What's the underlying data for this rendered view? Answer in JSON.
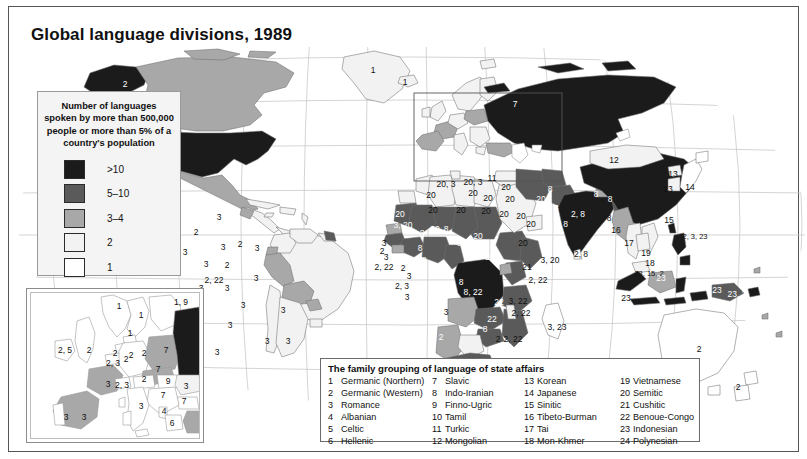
{
  "title": "Global language divisions, 1989",
  "legend": {
    "heading": "Number of languages spoken by more than 500,000 people or more than 5% of a country's population",
    "classes": [
      {
        "label": ">10",
        "color": "#1b1b1b"
      },
      {
        "label": "5–10",
        "color": "#5a5a5a"
      },
      {
        "label": "3–4",
        "color": "#a8a8a8"
      },
      {
        "label": "2",
        "color": "#f2f2f2"
      },
      {
        "label": "1",
        "color": "#ffffff"
      }
    ]
  },
  "family_table": {
    "title": "The family grouping of language of state affairs",
    "columns": [
      [
        {
          "n": "1",
          "label": "Germanic (Northern)"
        },
        {
          "n": "2",
          "label": "Germanic (Western)"
        },
        {
          "n": "3",
          "label": "Romance"
        },
        {
          "n": "4",
          "label": "Albanian"
        },
        {
          "n": "5",
          "label": "Celtic"
        },
        {
          "n": "6",
          "label": "Hellenic"
        }
      ],
      [
        {
          "n": "7",
          "label": "Slavic"
        },
        {
          "n": "8",
          "label": "Indo-Iranian"
        },
        {
          "n": "9",
          "label": "Finno-Ugric"
        },
        {
          "n": "10",
          "label": "Tamil"
        },
        {
          "n": "11",
          "label": "Turkic"
        },
        {
          "n": "12",
          "label": "Mongolian"
        }
      ],
      [
        {
          "n": "13",
          "label": "Korean"
        },
        {
          "n": "14",
          "label": "Japanese"
        },
        {
          "n": "15",
          "label": "Sinitic"
        },
        {
          "n": "16",
          "label": "Tibeto-Burman"
        },
        {
          "n": "17",
          "label": "Tai"
        },
        {
          "n": "18",
          "label": "Mon-Khmer"
        }
      ],
      [
        {
          "n": "19",
          "label": "Vietnamese"
        },
        {
          "n": "20",
          "label": "Semitic"
        },
        {
          "n": "21",
          "label": "Cushitic"
        },
        {
          "n": "22",
          "label": "Benoue-Congo"
        },
        {
          "n": "23",
          "label": "Indonesian"
        },
        {
          "n": "24",
          "label": "Polynesian"
        }
      ]
    ]
  },
  "map_labels": [
    {
      "t": "2",
      "x": 107,
      "y": 37,
      "c": "w"
    },
    {
      "t": "2, 3",
      "x": 151,
      "y": 56,
      "c": "b"
    },
    {
      "t": "2",
      "x": 153,
      "y": 99,
      "c": "w"
    },
    {
      "t": "3",
      "x": 135,
      "y": 158,
      "c": "b"
    },
    {
      "t": "2",
      "x": 178,
      "y": 185,
      "c": "b"
    },
    {
      "t": "3",
      "x": 201,
      "y": 170,
      "c": "b"
    },
    {
      "t": "3",
      "x": 167,
      "y": 205,
      "c": "b"
    },
    {
      "t": "3",
      "x": 205,
      "y": 200,
      "c": "b"
    },
    {
      "t": "2",
      "x": 222,
      "y": 197,
      "c": "b"
    },
    {
      "t": "3",
      "x": 239,
      "y": 201,
      "c": "b"
    },
    {
      "t": "1",
      "x": 355,
      "y": 23,
      "c": "b"
    },
    {
      "t": "1",
      "x": 387,
      "y": 35,
      "c": "b"
    },
    {
      "t": "3",
      "x": 188,
      "y": 217,
      "c": "b"
    },
    {
      "t": "2",
      "x": 209,
      "y": 218,
      "c": "b"
    },
    {
      "t": "2, 22",
      "x": 196,
      "y": 233,
      "c": "b"
    },
    {
      "t": "3",
      "x": 183,
      "y": 241,
      "c": "b"
    },
    {
      "t": "3",
      "x": 209,
      "y": 241,
      "c": "b"
    },
    {
      "t": "3",
      "x": 238,
      "y": 231,
      "c": "b"
    },
    {
      "t": "3",
      "x": 225,
      "y": 258,
      "c": "b"
    },
    {
      "t": "3",
      "x": 212,
      "y": 278,
      "c": "b"
    },
    {
      "t": "3",
      "x": 265,
      "y": 263,
      "c": "b"
    },
    {
      "t": "3",
      "x": 249,
      "y": 294,
      "c": "b"
    },
    {
      "t": "3",
      "x": 270,
      "y": 294,
      "c": "b"
    },
    {
      "t": "3",
      "x": 199,
      "y": 305,
      "c": "b"
    },
    {
      "t": "7",
      "x": 497,
      "y": 57,
      "c": "w"
    },
    {
      "t": "12",
      "x": 596,
      "y": 113,
      "c": "b"
    },
    {
      "t": "15",
      "x": 671,
      "y": 136,
      "c": "w"
    },
    {
      "t": "13",
      "x": 655,
      "y": 127,
      "c": "b"
    },
    {
      "t": "13",
      "x": 650,
      "y": 142,
      "c": "b"
    },
    {
      "t": "14",
      "x": 672,
      "y": 140,
      "c": "b"
    },
    {
      "t": "15",
      "x": 651,
      "y": 173,
      "c": "b"
    },
    {
      "t": "2, 3, 23",
      "x": 677,
      "y": 190,
      "c": "b"
    },
    {
      "t": "16",
      "x": 598,
      "y": 183,
      "c": "b"
    },
    {
      "t": "17",
      "x": 611,
      "y": 196,
      "c": "b"
    },
    {
      "t": "19",
      "x": 628,
      "y": 206,
      "c": "b"
    },
    {
      "t": "18",
      "x": 632,
      "y": 216,
      "c": "b"
    },
    {
      "t": "23, 15, 2",
      "x": 631,
      "y": 227,
      "c": "b"
    },
    {
      "t": "8",
      "x": 578,
      "y": 147,
      "c": "w"
    },
    {
      "t": "8",
      "x": 592,
      "y": 152,
      "c": "w"
    },
    {
      "t": "2, 8",
      "x": 560,
      "y": 167,
      "c": "w"
    },
    {
      "t": "8",
      "x": 591,
      "y": 171,
      "c": "b"
    },
    {
      "t": "2, 8",
      "x": 563,
      "y": 207,
      "c": "b"
    },
    {
      "t": "5, 8",
      "x": 543,
      "y": 177,
      "c": "w"
    },
    {
      "t": "8",
      "x": 538,
      "y": 161,
      "c": "w"
    },
    {
      "t": "8",
      "x": 532,
      "y": 142,
      "c": "w"
    },
    {
      "t": "11",
      "x": 474,
      "y": 131,
      "c": "b"
    },
    {
      "t": "20, 3",
      "x": 428,
      "y": 137,
      "c": "b"
    },
    {
      "t": "20, 3",
      "x": 455,
      "y": 135,
      "c": "b"
    },
    {
      "t": "20",
      "x": 455,
      "y": 146,
      "c": "b"
    },
    {
      "t": "20",
      "x": 488,
      "y": 140,
      "c": "b"
    },
    {
      "t": "20",
      "x": 492,
      "y": 152,
      "c": "b"
    },
    {
      "t": "20",
      "x": 486,
      "y": 167,
      "c": "b"
    },
    {
      "t": "20",
      "x": 503,
      "y": 169,
      "c": "b"
    },
    {
      "t": "20",
      "x": 513,
      "y": 177,
      "c": "b"
    },
    {
      "t": "20",
      "x": 505,
      "y": 196,
      "c": "b"
    },
    {
      "t": "20",
      "x": 523,
      "y": 152,
      "c": "w"
    },
    {
      "t": "20",
      "x": 413,
      "y": 148,
      "c": "b"
    },
    {
      "t": "20",
      "x": 415,
      "y": 163,
      "c": "b"
    },
    {
      "t": "20",
      "x": 443,
      "y": 163,
      "c": "b"
    },
    {
      "t": "20",
      "x": 468,
      "y": 164,
      "c": "b"
    },
    {
      "t": "20",
      "x": 470,
      "y": 151,
      "c": "b"
    },
    {
      "t": "3, 20",
      "x": 385,
      "y": 178,
      "c": "w"
    },
    {
      "t": "20",
      "x": 382,
      "y": 167,
      "c": "w"
    },
    {
      "t": "20",
      "x": 417,
      "y": 182,
      "c": "w"
    },
    {
      "t": "20",
      "x": 460,
      "y": 189,
      "c": "w"
    },
    {
      "t": "20",
      "x": 472,
      "y": 210,
      "c": "w"
    },
    {
      "t": "3, 20",
      "x": 532,
      "y": 213,
      "c": "b"
    },
    {
      "t": "21",
      "x": 509,
      "y": 220,
      "c": "b"
    },
    {
      "t": "2, 22",
      "x": 520,
      "y": 233,
      "c": "b"
    },
    {
      "t": "3",
      "x": 366,
      "y": 196,
      "c": "b"
    },
    {
      "t": "2",
      "x": 364,
      "y": 204,
      "c": "b"
    },
    {
      "t": "3",
      "x": 368,
      "y": 210,
      "c": "b"
    },
    {
      "t": "2, 22",
      "x": 366,
      "y": 220,
      "c": "b"
    },
    {
      "t": "2",
      "x": 385,
      "y": 221,
      "c": "b"
    },
    {
      "t": "8",
      "x": 394,
      "y": 214,
      "c": "w"
    },
    {
      "t": "8",
      "x": 406,
      "y": 213,
      "c": "w"
    },
    {
      "t": "8",
      "x": 402,
      "y": 201,
      "c": "w"
    },
    {
      "t": "8",
      "x": 404,
      "y": 186,
      "c": "w"
    },
    {
      "t": "8",
      "x": 428,
      "y": 182,
      "c": "w"
    },
    {
      "t": "8",
      "x": 441,
      "y": 196,
      "c": "w"
    },
    {
      "t": "3",
      "x": 391,
      "y": 229,
      "c": "b"
    },
    {
      "t": "2, 3",
      "x": 384,
      "y": 239,
      "c": "b"
    },
    {
      "t": "3",
      "x": 389,
      "y": 250,
      "c": "b"
    },
    {
      "t": "8",
      "x": 430,
      "y": 237,
      "c": "w"
    },
    {
      "t": "8",
      "x": 443,
      "y": 235,
      "c": "w"
    },
    {
      "t": "8, 22",
      "x": 455,
      "y": 245,
      "c": "w"
    },
    {
      "t": "3, 22",
      "x": 500,
      "y": 254,
      "c": "b"
    },
    {
      "t": "22",
      "x": 481,
      "y": 255,
      "c": "w"
    },
    {
      "t": "2, 22",
      "x": 503,
      "y": 266,
      "c": "b"
    },
    {
      "t": "22",
      "x": 474,
      "y": 272,
      "c": "w"
    },
    {
      "t": "8",
      "x": 467,
      "y": 282,
      "c": "w"
    },
    {
      "t": "2",
      "x": 480,
      "y": 292,
      "c": "b"
    },
    {
      "t": "2, 22",
      "x": 495,
      "y": 292,
      "c": "b"
    },
    {
      "t": "3",
      "x": 428,
      "y": 265,
      "c": "b"
    },
    {
      "t": "2",
      "x": 423,
      "y": 290,
      "c": "w"
    },
    {
      "t": "2",
      "x": 432,
      "y": 320,
      "c": "w"
    },
    {
      "t": "2, 22",
      "x": 462,
      "y": 337,
      "c": "b"
    },
    {
      "t": "3, 23",
      "x": 539,
      "y": 280,
      "c": "b"
    },
    {
      "t": "23",
      "x": 608,
      "y": 251,
      "c": "b"
    },
    {
      "t": "23",
      "x": 643,
      "y": 231,
      "c": "w"
    },
    {
      "t": "23",
      "x": 699,
      "y": 243,
      "c": "w"
    },
    {
      "t": "23, 2",
      "x": 719,
      "y": 247,
      "c": "w"
    },
    {
      "t": "2",
      "x": 681,
      "y": 302,
      "c": "b"
    },
    {
      "t": "2",
      "x": 720,
      "y": 340,
      "c": "b"
    }
  ],
  "inset_labels": [
    {
      "t": "1",
      "x": 88,
      "y": 13
    },
    {
      "t": "1",
      "x": 110,
      "y": 22
    },
    {
      "t": "1, 9",
      "x": 150,
      "y": 9
    },
    {
      "t": "1",
      "x": 99,
      "y": 40
    },
    {
      "t": "2, 5",
      "x": 34,
      "y": 57
    },
    {
      "t": "2",
      "x": 58,
      "y": 57
    },
    {
      "t": "2",
      "x": 84,
      "y": 60
    },
    {
      "t": "2",
      "x": 100,
      "y": 62
    },
    {
      "t": "2, 3",
      "x": 82,
      "y": 70
    },
    {
      "t": "2",
      "x": 95,
      "y": 66
    },
    {
      "t": "2",
      "x": 113,
      "y": 60
    },
    {
      "t": "7",
      "x": 135,
      "y": 57
    },
    {
      "t": "7",
      "x": 170,
      "y": 58
    },
    {
      "t": "7",
      "x": 127,
      "y": 76
    },
    {
      "t": "2",
      "x": 113,
      "y": 86
    },
    {
      "t": "9",
      "x": 137,
      "y": 88
    },
    {
      "t": "3",
      "x": 155,
      "y": 93
    },
    {
      "t": "2, 3",
      "x": 91,
      "y": 92
    },
    {
      "t": "3",
      "x": 77,
      "y": 91
    },
    {
      "t": "7",
      "x": 132,
      "y": 102
    },
    {
      "t": "7",
      "x": 153,
      "y": 108
    },
    {
      "t": "3",
      "x": 110,
      "y": 113
    },
    {
      "t": "4",
      "x": 133,
      "y": 118
    },
    {
      "t": "6",
      "x": 141,
      "y": 130
    },
    {
      "t": "11",
      "x": 174,
      "y": 130
    },
    {
      "t": "3",
      "x": 53,
      "y": 124
    },
    {
      "t": "3",
      "x": 35,
      "y": 124
    }
  ]
}
